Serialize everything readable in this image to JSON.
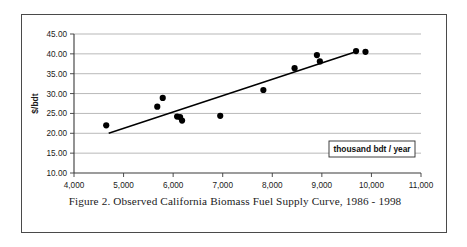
{
  "figure": {
    "caption": "Figure 2.  Observed California Biomass Fuel Supply Curve, 1986 - 1998"
  },
  "legend": {
    "label": "thousand bdt / year"
  },
  "colors": {
    "point": "#000000",
    "trendline": "#000000",
    "gridline": "#9a9a9a",
    "axis": "#3a3a3a",
    "frame": "#4a4a4a",
    "background": "#ffffff",
    "text": "#1a1a1a"
  },
  "chart_data": {
    "type": "scatter",
    "title": "",
    "subtitle": "",
    "xlabel": "thousand bdt / year",
    "ylabel": "$/bdt",
    "xlim": [
      4000,
      11000
    ],
    "ylim": [
      10.0,
      45.0
    ],
    "xticks": [
      4000,
      5000,
      6000,
      7000,
      8000,
      9000,
      10000,
      11000
    ],
    "xtick_labels": [
      "4,000",
      "5,000",
      "6,000",
      "7,000",
      "8,000",
      "9,000",
      "10,000",
      "11,000"
    ],
    "yticks": [
      10.0,
      15.0,
      20.0,
      25.0,
      30.0,
      35.0,
      40.0,
      45.0
    ],
    "ytick_labels": [
      "10.00",
      "15.00",
      "20.00",
      "25.00",
      "30.00",
      "35.00",
      "40.00",
      "45.00"
    ],
    "grid": "horizontal",
    "legend_position": "inside-bottom-right",
    "series": [
      {
        "name": "Observed biomass fuel supply",
        "type": "scatter",
        "marker": "filled-circle",
        "points": [
          {
            "x": 4650,
            "y": 22.0
          },
          {
            "x": 5680,
            "y": 26.7
          },
          {
            "x": 5790,
            "y": 28.9
          },
          {
            "x": 6080,
            "y": 24.2
          },
          {
            "x": 6140,
            "y": 24.1
          },
          {
            "x": 6180,
            "y": 23.2
          },
          {
            "x": 6950,
            "y": 24.4
          },
          {
            "x": 7820,
            "y": 30.9
          },
          {
            "x": 8450,
            "y": 36.4
          },
          {
            "x": 8900,
            "y": 39.7
          },
          {
            "x": 8960,
            "y": 38.1
          },
          {
            "x": 9690,
            "y": 40.7
          },
          {
            "x": 9880,
            "y": 40.5
          }
        ]
      },
      {
        "name": "Fitted supply curve",
        "type": "line",
        "points": [
          {
            "x": 4700,
            "y": 20.0
          },
          {
            "x": 9700,
            "y": 40.6
          }
        ]
      }
    ],
    "annotations": []
  }
}
